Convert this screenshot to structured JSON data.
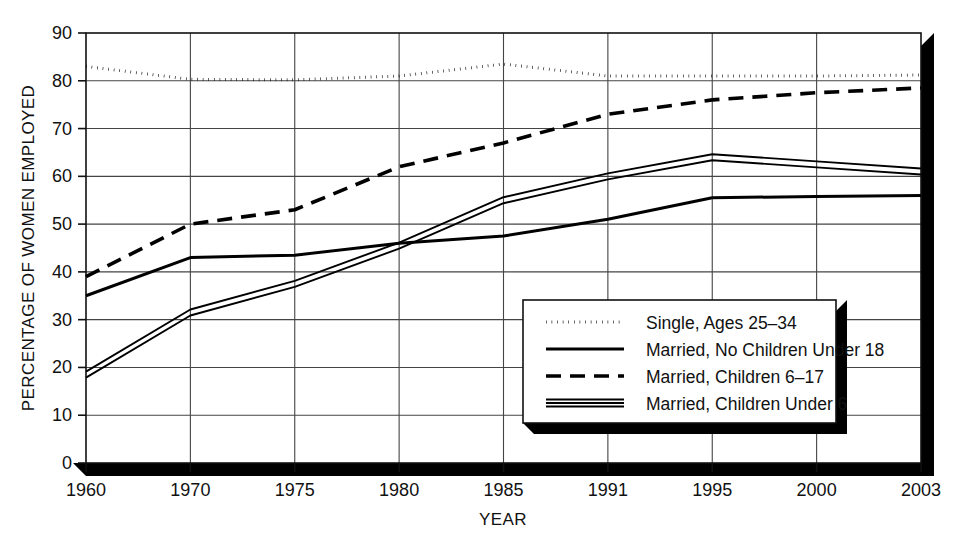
{
  "chart_data": {
    "type": "line",
    "title": "",
    "xlabel": "YEAR",
    "ylabel": "PERCENTAGE OF WOMEN EMPLOYED",
    "categories": [
      "1960",
      "1970",
      "1975",
      "1980",
      "1985",
      "1991",
      "1995",
      "2000",
      "2003"
    ],
    "ylim": [
      0,
      90
    ],
    "yticks": [
      "0",
      "10",
      "20",
      "30",
      "40",
      "50",
      "60",
      "70",
      "80",
      "90"
    ],
    "grid": true,
    "legend_position": "lower-right-inside",
    "series": [
      {
        "name": "Single, Ages 25–34",
        "style": "dotted",
        "values": [
          83.0,
          80.3,
          80.2,
          81.0,
          83.5,
          81.0,
          81.0,
          81.0,
          81.2
        ]
      },
      {
        "name": "Married, No Children Under 18",
        "style": "solid",
        "values": [
          35.0,
          43.0,
          43.5,
          46.0,
          47.5,
          51.0,
          55.5,
          55.8,
          56.0
        ]
      },
      {
        "name": "Married, Children 6–17",
        "style": "dashed",
        "values": [
          39.0,
          50.0,
          53.0,
          62.0,
          67.0,
          73.0,
          76.0,
          77.5,
          78.5
        ]
      },
      {
        "name": "Married, Children Under 6",
        "style": "double",
        "values": [
          18.5,
          31.5,
          37.5,
          45.5,
          55.0,
          60.0,
          64.0,
          62.5,
          61.0
        ]
      }
    ]
  },
  "legend": {
    "items": [
      {
        "label": "Single, Ages 25–34",
        "style": "dotted"
      },
      {
        "label": "Married, No Children Under 18",
        "style": "solid"
      },
      {
        "label": "Married, Children 6–17",
        "style": "dashed"
      },
      {
        "label": "Married, Children Under 6",
        "style": "double"
      }
    ]
  }
}
